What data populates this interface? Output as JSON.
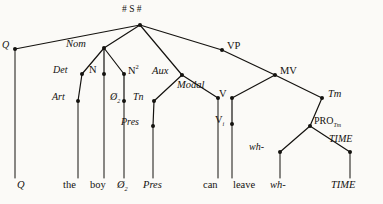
{
  "diagram": {
    "type": "phrase-structure-tree",
    "ink_color": "#14120f",
    "background_color": "#fbfaf7",
    "root_label": "# S #"
  },
  "nodes": [
    {
      "id": "root",
      "label": "# S #",
      "x": 140,
      "y": 25,
      "label_x": 122,
      "label_y": 5,
      "style": "upright",
      "size": 9.5
    },
    {
      "id": "q",
      "label": "Q",
      "x": 15,
      "y": 49,
      "label_x": 2,
      "label_y": 40,
      "style": "italic",
      "size": 10
    },
    {
      "id": "nom",
      "label": "Nom",
      "x": 104,
      "y": 48,
      "label_x": 66,
      "label_y": 39,
      "style": "italic",
      "size": 10.5
    },
    {
      "id": "det",
      "label": "Det",
      "x": 82,
      "y": 74,
      "label_x": 53,
      "label_y": 65,
      "style": "italic",
      "size": 10
    },
    {
      "id": "n",
      "label": "N",
      "x": 104,
      "y": 74,
      "label_x": 89,
      "label_y": 65,
      "style": "upright",
      "size": 10.5
    },
    {
      "id": "n2",
      "label": "N",
      "sup": "2",
      "x": 124,
      "y": 74,
      "label_x": 128,
      "label_y": 64,
      "style": "upright",
      "size": 10.5
    },
    {
      "id": "art",
      "label": "Art",
      "x": 78,
      "y": 101,
      "label_x": 52,
      "label_y": 92,
      "style": "italic",
      "size": 10
    },
    {
      "id": "zero2",
      "label": "Ø",
      "sub2": "2",
      "x": 124,
      "y": 101,
      "label_x": 110,
      "label_y": 92,
      "style": "italic",
      "size": 10
    },
    {
      "id": "tn",
      "label": "Tn",
      "x": 154,
      "y": 101,
      "label_x": 133,
      "label_y": 92,
      "style": "italic",
      "size": 10
    },
    {
      "id": "pres",
      "label": "Pres",
      "x": 153,
      "y": 126,
      "label_x": 121,
      "label_y": 117,
      "style": "italic",
      "size": 10
    },
    {
      "id": "aux",
      "label": "Aux",
      "x": 182,
      "y": 75,
      "label_x": 152,
      "label_y": 66,
      "style": "italic",
      "size": 10.5
    },
    {
      "id": "modal",
      "label": "Modal",
      "x": 218,
      "y": 98,
      "label_x": 177,
      "label_y": 80,
      "style": "italic",
      "size": 10.5
    },
    {
      "id": "v",
      "label": "V",
      "x": 232,
      "y": 98,
      "label_x": 219,
      "label_y": 89,
      "style": "upright",
      "size": 10.5
    },
    {
      "id": "vp",
      "label": "VP",
      "x": 222,
      "y": 50,
      "label_x": 227,
      "label_y": 41,
      "style": "upright",
      "size": 10.5
    },
    {
      "id": "mv",
      "label": "MV",
      "x": 275,
      "y": 75,
      "label_x": 280,
      "label_y": 66,
      "style": "upright",
      "size": 10.5
    },
    {
      "id": "vi",
      "label": "V",
      "sub": "i",
      "x": 232,
      "y": 124,
      "label_x": 215,
      "label_y": 115,
      "style": "upright",
      "size": 10.5
    },
    {
      "id": "tm",
      "label": "Tm",
      "x": 322,
      "y": 98,
      "label_x": 328,
      "label_y": 89,
      "style": "italic",
      "size": 10.5
    },
    {
      "id": "pro",
      "label": "PRO",
      "sub": "Tm",
      "x": 310,
      "y": 126,
      "label_x": 314,
      "label_y": 116,
      "style": "upright",
      "size": 10
    },
    {
      "id": "wh",
      "label": "wh-",
      "x": 280,
      "y": 152,
      "label_x": 249,
      "label_y": 142,
      "style": "italic",
      "size": 10
    },
    {
      "id": "time",
      "label": "TIME",
      "x": 350,
      "y": 152,
      "label_x": 329,
      "label_y": 134,
      "style": "italic",
      "size": 10
    }
  ],
  "edges": [
    {
      "from": "root",
      "to": "q"
    },
    {
      "from": "root",
      "to": "nom"
    },
    {
      "from": "root",
      "to": "vp"
    },
    {
      "from": "root",
      "to": "aux"
    },
    {
      "from": "nom",
      "to": "det"
    },
    {
      "from": "nom",
      "to": "n"
    },
    {
      "from": "nom",
      "to": "n2"
    },
    {
      "from": "det",
      "to": "art"
    },
    {
      "from": "n2",
      "to": "zero2"
    },
    {
      "from": "aux",
      "to": "tn"
    },
    {
      "from": "tn",
      "to": "pres"
    },
    {
      "from": "aux",
      "to": "modal"
    },
    {
      "from": "vp",
      "to": "mv"
    },
    {
      "from": "mv",
      "to": "v"
    },
    {
      "from": "mv",
      "to": "tm"
    },
    {
      "from": "v",
      "to": "vi"
    },
    {
      "from": "tm",
      "to": "pro"
    },
    {
      "from": "pro",
      "to": "wh"
    },
    {
      "from": "pro",
      "to": "time"
    }
  ],
  "terminal_stems": [
    {
      "id": "stem-q",
      "x": 15,
      "y1": 49,
      "y2": 178
    },
    {
      "id": "stem-art",
      "x": 78,
      "y1": 101,
      "y2": 178
    },
    {
      "id": "stem-n",
      "x": 104,
      "y1": 74,
      "y2": 178
    },
    {
      "id": "stem-zero2",
      "x": 124,
      "y1": 101,
      "y2": 178
    },
    {
      "id": "stem-pres",
      "x": 153,
      "y1": 126,
      "y2": 178
    },
    {
      "id": "stem-modal",
      "x": 218,
      "y1": 98,
      "y2": 178
    },
    {
      "id": "stem-vi",
      "x": 232,
      "y1": 124,
      "y2": 178
    },
    {
      "id": "stem-wh",
      "x": 280,
      "y1": 152,
      "y2": 178
    },
    {
      "id": "stem-time",
      "x": 350,
      "y1": 152,
      "y2": 178
    }
  ],
  "terminals": [
    {
      "id": "t-q",
      "text": "Q",
      "x": 17,
      "y": 180,
      "style": "italic",
      "size": 10.5
    },
    {
      "id": "t-the",
      "text": "the",
      "x": 63,
      "y": 180,
      "style": "upright",
      "size": 10.5
    },
    {
      "id": "t-boy",
      "text": "boy",
      "x": 90,
      "y": 180,
      "style": "upright",
      "size": 10.5
    },
    {
      "id": "t-zero2",
      "text": "Ø",
      "sub2": "2",
      "x": 117,
      "y": 180,
      "style": "italic",
      "size": 10.5
    },
    {
      "id": "t-pres",
      "text": "Pres",
      "x": 143,
      "y": 180,
      "style": "italic",
      "size": 10.5
    },
    {
      "id": "t-can",
      "text": "can",
      "x": 203,
      "y": 180,
      "style": "upright",
      "size": 10.5
    },
    {
      "id": "t-leave",
      "text": "leave",
      "x": 233,
      "y": 180,
      "style": "upright",
      "size": 10.5
    },
    {
      "id": "t-wh",
      "text": "wh-",
      "x": 270,
      "y": 180,
      "style": "italic",
      "size": 10.5
    },
    {
      "id": "t-time",
      "text": "TIME",
      "x": 331,
      "y": 180,
      "style": "italic",
      "size": 10.5
    }
  ]
}
